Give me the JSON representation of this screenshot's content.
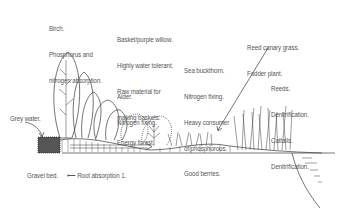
{
  "diagram": {
    "type": "illustration",
    "labels": [
      {
        "id": "birch",
        "lines": [
          "Birch.",
          "Phosphorus and",
          "nitrogen absorption."
        ]
      },
      {
        "id": "willow",
        "lines": [
          "Basket/purple willow.",
          "Highly water tolerant.",
          "Raw material for",
          "making baskets.",
          "Energy forest."
        ]
      },
      {
        "id": "alder",
        "lines": [
          "Alder.",
          "Nitrogen fixing."
        ]
      },
      {
        "id": "sea-buckthorn",
        "lines": [
          "Sea buckthorn.",
          "Nitrogen fixing.",
          "Heavy consumer",
          "of phosphorous.",
          "Good berries."
        ]
      },
      {
        "id": "reed-canary",
        "lines": [
          "Reed canary grass.",
          "Fodder plant."
        ]
      },
      {
        "id": "reeds-cattails",
        "lines": [
          "Reeds.",
          "Denitrification.",
          "Cattails.",
          "Denitrification."
        ]
      },
      {
        "id": "grey-water",
        "lines": [
          "Grey water."
        ]
      },
      {
        "id": "gravel-bed",
        "lines": [
          "Gravel bed."
        ]
      },
      {
        "id": "root-absorption",
        "lines": [
          "Root absorption 1."
        ]
      }
    ]
  }
}
